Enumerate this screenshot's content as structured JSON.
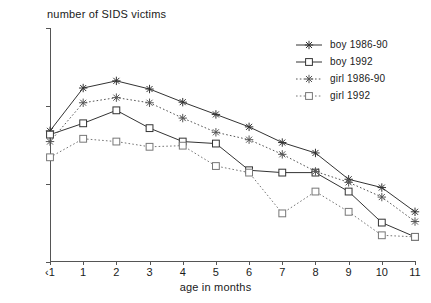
{
  "chart_data": {
    "type": "line",
    "title": "number of SIDS victims",
    "xlabel": "age in months",
    "ylabel": "",
    "yscale": "log",
    "ylim": [
      1,
      1000
    ],
    "yticks": [
      1,
      10,
      100,
      1000
    ],
    "ytick_labels": [
      "1",
      "10",
      "100",
      "1000"
    ],
    "grid": false,
    "legend_position": "top-right",
    "categories": [
      "<1",
      "1",
      "2",
      "3",
      "4",
      "5",
      "6",
      "7",
      "8",
      "9",
      "10",
      "11"
    ],
    "xtick_labels": [
      "‹1",
      "1",
      "2",
      "3",
      "4",
      "5",
      "6",
      "7",
      "8",
      "9",
      "10",
      "11"
    ],
    "series": [
      {
        "name": "boy 1986-90",
        "marker": "star",
        "line": "solid",
        "color": "#333333",
        "values": [
          48,
          170,
          210,
          165,
          112,
          78,
          54,
          34,
          25,
          11.5,
          9,
          4.4
        ]
      },
      {
        "name": "boy 1992",
        "marker": "square",
        "line": "solid",
        "color": "#333333",
        "values": [
          43,
          60,
          88,
          52,
          35,
          33,
          15,
          14,
          14,
          8,
          3.2,
          2.1
        ]
      },
      {
        "name": "girl 1986-90",
        "marker": "star",
        "line": "dotted",
        "color": "#555555",
        "values": [
          35,
          110,
          128,
          110,
          70,
          46,
          37,
          24,
          14.5,
          10.5,
          6.8,
          3.3
        ]
      },
      {
        "name": "girl 1992",
        "marker": "square",
        "line": "dotted",
        "color": "#777777",
        "values": [
          22,
          38,
          35,
          30,
          31,
          17,
          14,
          4.2,
          8,
          4.4,
          2.2,
          2.1
        ]
      }
    ]
  },
  "legend": {
    "items": [
      {
        "label": "boy 1986-90"
      },
      {
        "label": "boy 1992"
      },
      {
        "label": "girl 1986-90"
      },
      {
        "label": "girl 1992"
      }
    ]
  }
}
